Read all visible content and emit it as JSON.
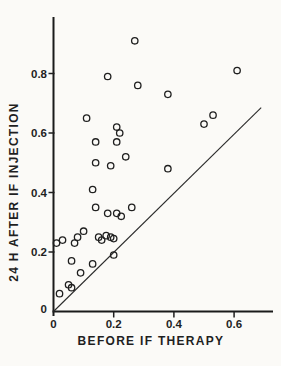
{
  "figure": {
    "background_color": "#fbfaf7",
    "ink_color": "#1f1f1f"
  },
  "chart_data": {
    "type": "scatter",
    "title": "",
    "xlabel": "BEFORE IF THERAPY",
    "ylabel": "24 H AFTER IF INJECTION",
    "xlim": [
      0,
      0.75
    ],
    "ylim": [
      0,
      0.99
    ],
    "grid": false,
    "legend": null,
    "marker": "open-circle",
    "xticks": [
      {
        "value": 0,
        "label": "0"
      },
      {
        "value": 0.2,
        "label": "0.2"
      },
      {
        "value": 0.4,
        "label": "0.4"
      },
      {
        "value": 0.6,
        "label": "0.6"
      }
    ],
    "yticks": [
      {
        "value": 0,
        "label": "0"
      },
      {
        "value": 0.2,
        "label": "0.2"
      },
      {
        "value": 0.4,
        "label": "0.4"
      },
      {
        "value": 0.6,
        "label": "0.6"
      },
      {
        "value": 0.8,
        "label": "0.8"
      }
    ],
    "points": [
      [
        0.27,
        0.91
      ],
      [
        0.61,
        0.81
      ],
      [
        0.18,
        0.79
      ],
      [
        0.28,
        0.76
      ],
      [
        0.38,
        0.73
      ],
      [
        0.53,
        0.66
      ],
      [
        0.11,
        0.65
      ],
      [
        0.5,
        0.63
      ],
      [
        0.21,
        0.62
      ],
      [
        0.22,
        0.6
      ],
      [
        0.14,
        0.57
      ],
      [
        0.21,
        0.57
      ],
      [
        0.24,
        0.52
      ],
      [
        0.14,
        0.5
      ],
      [
        0.19,
        0.49
      ],
      [
        0.38,
        0.48
      ],
      [
        0.13,
        0.41
      ],
      [
        0.14,
        0.35
      ],
      [
        0.26,
        0.35
      ],
      [
        0.18,
        0.33
      ],
      [
        0.21,
        0.33
      ],
      [
        0.225,
        0.32
      ],
      [
        0.1,
        0.27
      ],
      [
        0.01,
        0.23
      ],
      [
        0.03,
        0.24
      ],
      [
        0.07,
        0.23
      ],
      [
        0.08,
        0.25
      ],
      [
        0.15,
        0.25
      ],
      [
        0.16,
        0.24
      ],
      [
        0.175,
        0.255
      ],
      [
        0.19,
        0.25
      ],
      [
        0.2,
        0.245
      ],
      [
        0.2,
        0.19
      ],
      [
        0.06,
        0.17
      ],
      [
        0.13,
        0.16
      ],
      [
        0.09,
        0.13
      ],
      [
        0.05,
        0.09
      ],
      [
        0.06,
        0.08
      ],
      [
        0.02,
        0.06
      ]
    ],
    "reference_line": {
      "name": "line-of-identity",
      "from": [
        0,
        0
      ],
      "to": [
        0.69,
        0.685
      ]
    }
  }
}
